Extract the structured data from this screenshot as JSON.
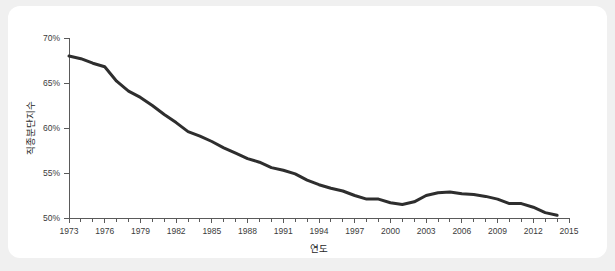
{
  "figure": {
    "background_color": "#f0f0f0",
    "card_color": "#ffffff"
  },
  "chart_data": {
    "type": "line",
    "title": "",
    "subtitle": "",
    "xlabel": "연도",
    "ylabel": "직종분단지수",
    "xlim": [
      1973,
      2015
    ],
    "ylim": [
      50,
      70
    ],
    "grid": false,
    "legend": "none",
    "line_color": "#2e2e2e",
    "axis_color": "#5a5a5a",
    "y_tick_labels": [
      "70%",
      "65%",
      "60%",
      "55%",
      "50%"
    ],
    "y_ticks": [
      70,
      65,
      60,
      55,
      50
    ],
    "x_tick_labels": [
      "1973",
      "1976",
      "1979",
      "1982",
      "1985",
      "1988",
      "1991",
      "1994",
      "1997",
      "2000",
      "2003",
      "2006",
      "2009",
      "2012",
      "2015"
    ],
    "x_ticks": [
      1973,
      1976,
      1979,
      1982,
      1985,
      1988,
      1991,
      1994,
      1997,
      2000,
      2003,
      2006,
      2009,
      2012,
      2015
    ],
    "x_minor_ticks": [
      1974,
      1975,
      1977,
      1978,
      1980,
      1981,
      1983,
      1984,
      1986,
      1987,
      1989,
      1990,
      1992,
      1993,
      1995,
      1996,
      1998,
      1999,
      2001,
      2002,
      2004,
      2005,
      2007,
      2008,
      2010,
      2011,
      2013,
      2014
    ],
    "series": [
      {
        "name": "직종분단지수",
        "x": [
          1973,
          1974,
          1975,
          1976,
          1977,
          1978,
          1979,
          1980,
          1981,
          1982,
          1983,
          1984,
          1985,
          1986,
          1987,
          1988,
          1989,
          1990,
          1991,
          1992,
          1993,
          1994,
          1995,
          1996,
          1997,
          1998,
          1999,
          2000,
          2001,
          2002,
          2003,
          2004,
          2005,
          2006,
          2007,
          2008,
          2009,
          2010,
          2011,
          2012,
          2013,
          2014
        ],
        "values": [
          68.0,
          67.7,
          67.2,
          66.8,
          65.2,
          64.1,
          63.4,
          62.5,
          61.5,
          60.6,
          59.6,
          59.1,
          58.5,
          57.8,
          57.2,
          56.6,
          56.2,
          55.6,
          55.3,
          54.9,
          54.2,
          53.7,
          53.3,
          53.0,
          52.5,
          52.1,
          52.1,
          51.7,
          51.5,
          51.8,
          52.5,
          52.8,
          52.9,
          52.7,
          52.6,
          52.4,
          52.1,
          51.6,
          51.6,
          51.2,
          50.6,
          50.3
        ]
      }
    ]
  }
}
